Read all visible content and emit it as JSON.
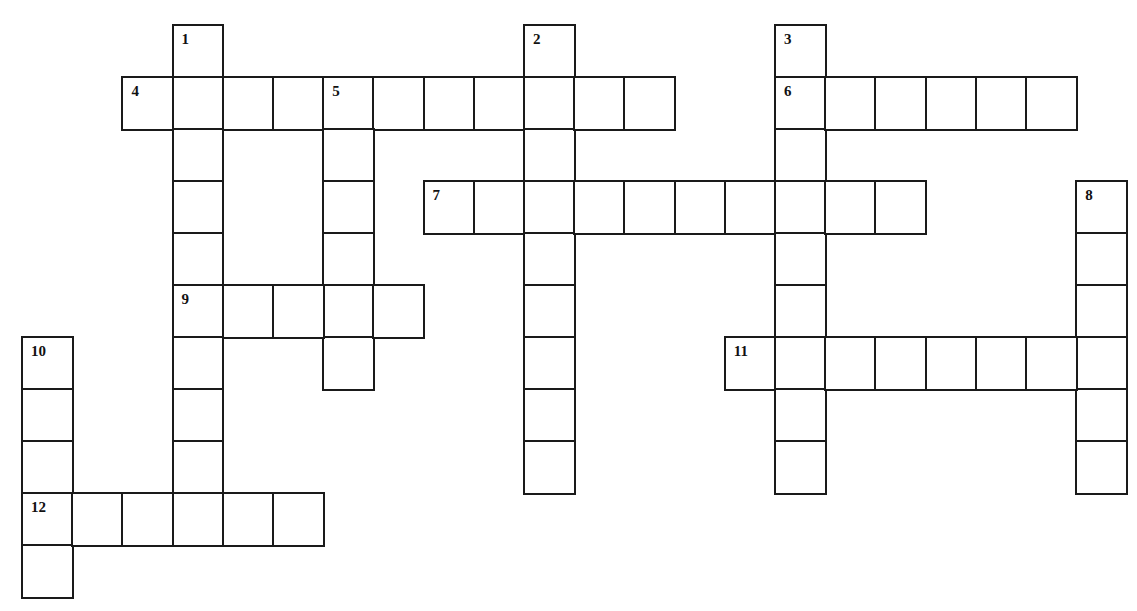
{
  "puzzle": {
    "type": "crossword",
    "grid_origin": {
      "x": 22,
      "y": 25
    },
    "cell_pitch": {
      "x": 50.2,
      "y": 52
    },
    "line_color": "#1a1a1a",
    "entries": [
      {
        "number": "1",
        "direction": "down",
        "col": 3,
        "row": 0,
        "length": 9
      },
      {
        "number": "2",
        "direction": "down",
        "col": 10,
        "row": 0,
        "length": 9
      },
      {
        "number": "3",
        "direction": "down",
        "col": 15,
        "row": 0,
        "length": 9
      },
      {
        "number": "4",
        "direction": "across",
        "col": 2,
        "row": 1,
        "length": 11
      },
      {
        "number": "5",
        "direction": "down",
        "col": 6,
        "row": 1,
        "length": 6
      },
      {
        "number": "6",
        "direction": "across",
        "col": 15,
        "row": 1,
        "length": 6
      },
      {
        "number": "7",
        "direction": "across",
        "col": 8,
        "row": 3,
        "length": 10
      },
      {
        "number": "8",
        "direction": "down",
        "col": 21,
        "row": 3,
        "length": 6
      },
      {
        "number": "9",
        "direction": "across",
        "col": 3,
        "row": 5,
        "length": 5
      },
      {
        "number": "10",
        "direction": "down",
        "col": 0,
        "row": 6,
        "length": 5
      },
      {
        "number": "11",
        "direction": "across",
        "col": 14,
        "row": 6,
        "length": 8
      },
      {
        "number": "12",
        "direction": "across",
        "col": 0,
        "row": 9,
        "length": 6
      }
    ]
  }
}
